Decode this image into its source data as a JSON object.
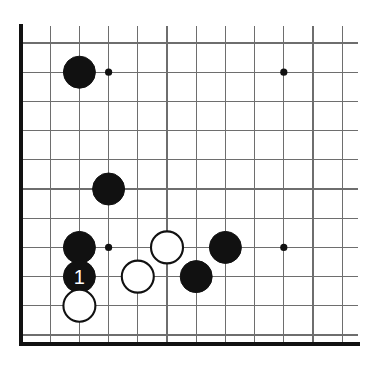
{
  "figure": {
    "kind": "go-board-diagram",
    "title": "",
    "caption": "",
    "corner": "lower-left",
    "colors": {
      "background": "#ffffff",
      "grid": "#6e6e6e",
      "border": "#111111",
      "black_stone": "#111111",
      "white_stone": "#ffffff",
      "stone_outline": "#111111",
      "label_on_black": "#ffffff"
    }
  },
  "board": {
    "origin_x": 21,
    "origin_y": 43,
    "spacing": 29.2,
    "columns": 12,
    "rows": 11,
    "left_border_x": 21,
    "bottom_border_y": 344,
    "grid_right_x": 358,
    "grid_top_y": 26,
    "stone_radius": 16,
    "star_radius": 3.6,
    "star_points": [
      {
        "col": 3,
        "row": 1
      },
      {
        "col": 9,
        "row": 1
      },
      {
        "col": 3,
        "row": 7
      },
      {
        "col": 9,
        "row": 7
      }
    ]
  },
  "stones": [
    {
      "id": "b1",
      "color": "black",
      "col": 2,
      "row": 1,
      "label": ""
    },
    {
      "id": "b2",
      "color": "black",
      "col": 3,
      "row": 5,
      "label": ""
    },
    {
      "id": "b3",
      "color": "black",
      "col": 2,
      "row": 7,
      "label": ""
    },
    {
      "id": "b4",
      "color": "black",
      "col": 2,
      "row": 8,
      "label": "1"
    },
    {
      "id": "w1",
      "color": "white",
      "col": 2,
      "row": 9,
      "label": ""
    },
    {
      "id": "w2",
      "color": "white",
      "col": 4,
      "row": 8,
      "label": ""
    },
    {
      "id": "w3",
      "color": "white",
      "col": 5,
      "row": 7,
      "label": ""
    },
    {
      "id": "b5",
      "color": "black",
      "col": 6,
      "row": 8,
      "label": ""
    },
    {
      "id": "b6",
      "color": "black",
      "col": 7,
      "row": 7,
      "label": ""
    }
  ],
  "move_labels": [
    {
      "number": "1",
      "color": "black",
      "col": 2,
      "row": 8
    }
  ]
}
